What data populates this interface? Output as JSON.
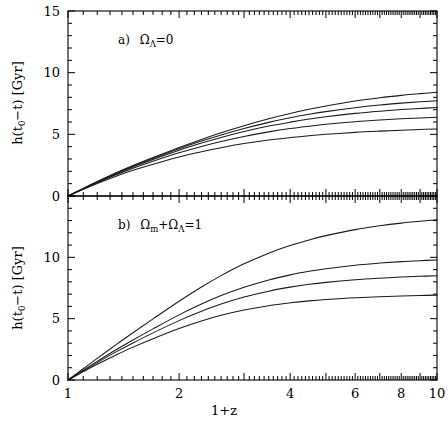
{
  "figure": {
    "background": "#ffffff",
    "line_color": "#1a1a1a",
    "axis_color": "#000000",
    "xlabel": "1+z",
    "ylabel_parts": {
      "h": "h(t",
      "sub0": "0",
      "minus_t": "−t) [Gyr]"
    },
    "ylabel_plain": "h(t0−t) [Gyr]"
  },
  "chart_data": [
    {
      "type": "line",
      "panel": "a",
      "title": "a)  ΩΛ=0",
      "label_parts": {
        "prefix": "a)",
        "omega": "Ω",
        "sub": "Λ",
        "suffix": "=0"
      },
      "xlabel": "1+z",
      "ylabel": "h(t0−t) [Gyr]",
      "xscale": "log",
      "xlim": [
        1,
        10
      ],
      "ylim": [
        0,
        15
      ],
      "xticks": [
        1,
        2,
        4,
        6,
        8,
        10
      ],
      "xticklabels": [
        "1",
        "2",
        "4",
        "6",
        "8",
        "10"
      ],
      "yticks": [
        0,
        5,
        10,
        15
      ],
      "yticklabels": [
        "0",
        "5",
        "10",
        "15"
      ],
      "yminor_step": 1,
      "grid": false,
      "legend": "none",
      "x": [
        1.0,
        1.1,
        1.2,
        1.35,
        1.5,
        1.7,
        2.0,
        2.3,
        2.6,
        3.0,
        3.5,
        4.0,
        4.5,
        5.0,
        6.0,
        7.0,
        8.0,
        9.0,
        10.0
      ],
      "series": [
        {
          "name": "curve-1",
          "values": [
            0.0,
            0.62,
            1.17,
            1.88,
            2.47,
            3.12,
            3.93,
            4.59,
            5.13,
            5.7,
            6.26,
            6.69,
            7.03,
            7.3,
            7.7,
            7.97,
            8.16,
            8.3,
            8.41
          ]
        },
        {
          "name": "curve-2",
          "values": [
            0.0,
            0.6,
            1.14,
            1.83,
            2.41,
            3.04,
            3.83,
            4.45,
            4.95,
            5.47,
            5.97,
            6.34,
            6.62,
            6.84,
            7.16,
            7.38,
            7.53,
            7.64,
            7.73
          ]
        },
        {
          "name": "curve-3",
          "values": [
            0.0,
            0.59,
            1.12,
            1.79,
            2.35,
            2.96,
            3.71,
            4.29,
            4.75,
            5.23,
            5.67,
            5.99,
            6.24,
            6.43,
            6.7,
            6.88,
            7.01,
            7.1,
            7.17
          ]
        },
        {
          "name": "curve-4",
          "values": [
            0.0,
            0.57,
            1.08,
            1.72,
            2.25,
            2.82,
            3.5,
            4.02,
            4.42,
            4.83,
            5.2,
            5.47,
            5.66,
            5.81,
            6.02,
            6.16,
            6.26,
            6.33,
            6.39
          ]
        },
        {
          "name": "curve-5",
          "values": [
            0.0,
            0.54,
            1.02,
            1.61,
            2.08,
            2.58,
            3.17,
            3.59,
            3.92,
            4.25,
            4.54,
            4.74,
            4.89,
            5.0,
            5.16,
            5.26,
            5.33,
            5.39,
            5.43
          ]
        }
      ]
    },
    {
      "type": "line",
      "panel": "b",
      "title": "b)  Ωm+ΩΛ=1",
      "label_parts": {
        "prefix": "b)",
        "omega1": "Ω",
        "sub1": "m",
        "plus": "+",
        "omega2": "Ω",
        "sub2": "Λ",
        "suffix": "=1"
      },
      "xlabel": "1+z",
      "ylabel": "h(t0−t) [Gyr]",
      "xscale": "log",
      "xlim": [
        1,
        10
      ],
      "ylim": [
        0,
        15
      ],
      "xticks": [
        1,
        2,
        4,
        6,
        8,
        10
      ],
      "xticklabels": [
        "1",
        "2",
        "4",
        "6",
        "8",
        "10"
      ],
      "yticks": [
        0,
        5,
        10,
        15
      ],
      "yticklabels": [
        "0",
        "5",
        "10",
        "15"
      ],
      "yminor_step": 1,
      "grid": false,
      "legend": "none",
      "x": [
        1.0,
        1.1,
        1.2,
        1.35,
        1.5,
        1.7,
        2.0,
        2.3,
        2.6,
        3.0,
        3.5,
        4.0,
        4.5,
        5.0,
        6.0,
        7.0,
        8.0,
        9.0,
        10.0
      ],
      "series": [
        {
          "name": "curve-1",
          "values": [
            0.0,
            0.92,
            1.76,
            2.88,
            3.85,
            4.98,
            6.42,
            7.58,
            8.51,
            9.47,
            10.34,
            10.96,
            11.42,
            11.77,
            12.26,
            12.57,
            12.79,
            12.94,
            13.06
          ]
        },
        {
          "name": "curve-2",
          "values": [
            0.0,
            0.8,
            1.52,
            2.46,
            3.26,
            4.17,
            5.31,
            6.19,
            6.88,
            7.56,
            8.16,
            8.57,
            8.86,
            9.07,
            9.36,
            9.53,
            9.65,
            9.73,
            9.79
          ]
        },
        {
          "name": "curve-3",
          "values": [
            0.0,
            0.75,
            1.42,
            2.29,
            3.02,
            3.84,
            4.84,
            5.6,
            6.19,
            6.76,
            7.24,
            7.57,
            7.8,
            7.96,
            8.17,
            8.3,
            8.39,
            8.45,
            8.5
          ]
        },
        {
          "name": "curve-4",
          "values": [
            0.0,
            0.68,
            1.28,
            2.04,
            2.68,
            3.37,
            4.2,
            4.81,
            5.27,
            5.7,
            6.06,
            6.29,
            6.45,
            6.56,
            6.71,
            6.79,
            6.85,
            6.89,
            6.92
          ]
        }
      ]
    }
  ]
}
